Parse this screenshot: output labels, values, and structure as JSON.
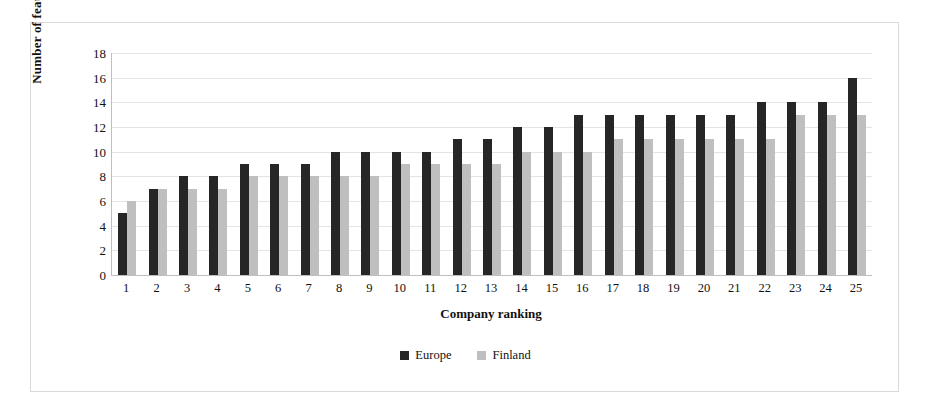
{
  "chart_data": {
    "type": "bar",
    "title": "",
    "xlabel": "Company ranking",
    "ylabel": "Number of features",
    "categories": [
      "1",
      "2",
      "3",
      "4",
      "5",
      "6",
      "7",
      "8",
      "9",
      "10",
      "11",
      "12",
      "13",
      "14",
      "15",
      "16",
      "17",
      "18",
      "19",
      "20",
      "21",
      "22",
      "23",
      "24",
      "25"
    ],
    "series": [
      {
        "name": "Europe",
        "color": "#262626",
        "values": [
          5,
          7,
          8,
          8,
          9,
          9,
          9,
          10,
          10,
          10,
          10,
          11,
          11,
          12,
          12,
          13,
          13,
          13,
          13,
          13,
          13,
          14,
          14,
          14,
          16
        ]
      },
      {
        "name": "Finland",
        "color": "#bfbfbf",
        "values": [
          6,
          7,
          7,
          7,
          8,
          8,
          8,
          8,
          8,
          9,
          9,
          9,
          9,
          10,
          10,
          10,
          11,
          11,
          11,
          11,
          11,
          11,
          13,
          13,
          13
        ]
      }
    ],
    "ylim": [
      0,
      18
    ],
    "yticks": [
      0,
      2,
      4,
      6,
      8,
      10,
      12,
      14,
      16,
      18
    ],
    "ytick_labels": [
      "0",
      "2",
      "4",
      "6",
      "8",
      "10",
      "12",
      "14",
      "16",
      "18"
    ],
    "grid": true,
    "legend_position": "bottom"
  }
}
